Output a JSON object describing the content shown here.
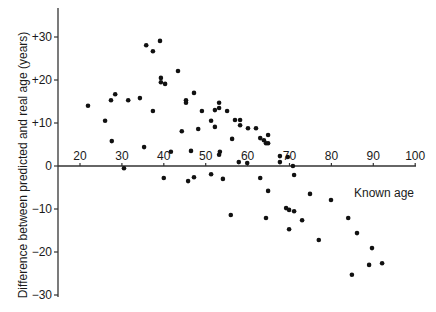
{
  "chart_data": {
    "type": "scatter",
    "title": "",
    "xlabel": "Known age",
    "ylabel": "Difference between predicted and real age (years)",
    "xlim": [
      20,
      100
    ],
    "ylim": [
      -30,
      30
    ],
    "x_ticks": [
      20,
      30,
      40,
      50,
      60,
      70,
      80,
      90,
      100
    ],
    "x_tick_labels": [
      "20",
      "30",
      "40",
      "50",
      "60",
      "70",
      "80",
      "90",
      "100"
    ],
    "y_ticks": [
      30,
      20,
      10,
      0,
      -10,
      -20,
      -30
    ],
    "y_tick_labels": [
      "+30",
      "+20",
      "+10",
      "0",
      "−10",
      "−20",
      "−30"
    ],
    "grid": false,
    "legend": null,
    "x_axis_position": "y=0 line",
    "series": [
      {
        "name": "observations",
        "points": [
          [
            21.9,
            14.0
          ],
          [
            26.0,
            10.5
          ],
          [
            27.6,
            5.8
          ],
          [
            27.4,
            15.3
          ],
          [
            28.4,
            16.7
          ],
          [
            30.5,
            -0.5
          ],
          [
            31.5,
            15.3
          ],
          [
            34.3,
            15.8
          ],
          [
            35.3,
            4.4
          ],
          [
            35.8,
            28.1
          ],
          [
            37.4,
            26.7
          ],
          [
            37.4,
            12.8
          ],
          [
            39.1,
            29.1
          ],
          [
            39.3,
            20.5
          ],
          [
            39.3,
            19.5
          ],
          [
            40.3,
            19.1
          ],
          [
            40.0,
            -2.8
          ],
          [
            41.7,
            3.3
          ],
          [
            43.4,
            22.1
          ],
          [
            44.3,
            8.1
          ],
          [
            45.3,
            15.3
          ],
          [
            45.3,
            14.7
          ],
          [
            45.8,
            -3.5
          ],
          [
            46.5,
            3.5
          ],
          [
            47.2,
            17.0
          ],
          [
            47.2,
            -2.6
          ],
          [
            48.2,
            8.6
          ],
          [
            49.1,
            12.8
          ],
          [
            51.3,
            10.5
          ],
          [
            51.3,
            -1.9
          ],
          [
            52.2,
            13.0
          ],
          [
            52.2,
            9.1
          ],
          [
            53.2,
            14.7
          ],
          [
            53.2,
            13.5
          ],
          [
            53.4,
            3.3
          ],
          [
            53.2,
            2.6
          ],
          [
            54.1,
            -3.0
          ],
          [
            55.1,
            12.8
          ],
          [
            56.0,
            -11.4
          ],
          [
            56.3,
            6.3
          ],
          [
            57.0,
            10.7
          ],
          [
            58.2,
            10.7
          ],
          [
            58.2,
            9.5
          ],
          [
            57.9,
            0.9
          ],
          [
            59.9,
            0.7
          ],
          [
            60.1,
            8.8
          ],
          [
            62.0,
            8.8
          ],
          [
            63.0,
            6.5
          ],
          [
            63.0,
            -2.8
          ],
          [
            63.9,
            6.0
          ],
          [
            64.9,
            7.2
          ],
          [
            64.4,
            5.3
          ],
          [
            64.9,
            5.3
          ],
          [
            64.4,
            -12.1
          ],
          [
            64.9,
            -5.8
          ],
          [
            67.7,
            2.3
          ],
          [
            67.7,
            0.9
          ],
          [
            69.6,
            2.1
          ],
          [
            70.8,
            0.0
          ],
          [
            71.1,
            -2.1
          ],
          [
            69.2,
            -9.8
          ],
          [
            69.9,
            -10.2
          ],
          [
            71.1,
            -10.5
          ],
          [
            73.0,
            -12.6
          ],
          [
            69.9,
            -14.7
          ],
          [
            74.9,
            -6.5
          ],
          [
            77.0,
            -17.2
          ],
          [
            79.9,
            -7.9
          ],
          [
            84.0,
            -12.1
          ],
          [
            86.1,
            -15.6
          ],
          [
            84.9,
            -25.3
          ],
          [
            89.7,
            -19.1
          ],
          [
            89.0,
            -23.0
          ],
          [
            92.1,
            -22.6
          ]
        ]
      }
    ]
  },
  "style": {
    "dot_color": "#111111",
    "axis_color": "#333333",
    "background": "#ffffff"
  },
  "layout": {
    "y_axis_x_px": 58,
    "y_axis_top_px": 8,
    "y_axis_bottom_px": 297,
    "x_axis_right_px": 416,
    "x_px_at_20": 80,
    "x_px_per_year": 4.19,
    "y_px_at_0": 166,
    "y_px_per_unit": 4.3
  }
}
